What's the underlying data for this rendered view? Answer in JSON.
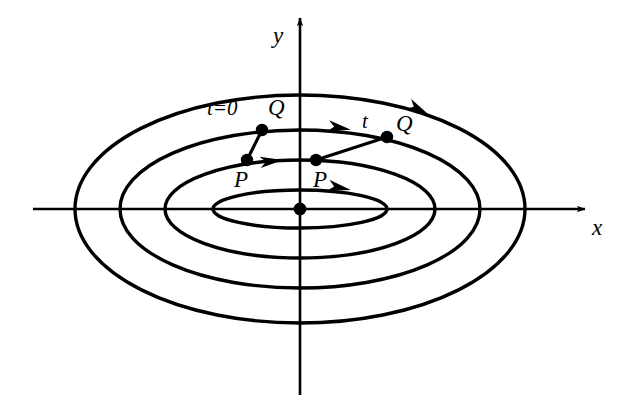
{
  "figure": {
    "background_color": "#ffffff",
    "stroke_color": "#000000",
    "width": 617,
    "height": 420
  },
  "axes": {
    "x_label": "x",
    "y_label": "y",
    "x_axis": {
      "x1": 33,
      "y1": 209,
      "x2": 585,
      "y2": 209
    },
    "y_axis": {
      "x1": 300,
      "y1": 395,
      "x2": 300,
      "y2": 18
    },
    "origin": {
      "x": 300,
      "y": 209
    },
    "x_label_pos": {
      "x": 592,
      "y": 216
    },
    "y_label_pos": {
      "x": 273,
      "y": 24
    }
  },
  "orbits": [
    {
      "name": "orbit-1-innermost",
      "cx": 300,
      "cy": 209,
      "rx": 87,
      "ry": 19
    },
    {
      "name": "orbit-2",
      "cx": 300,
      "cy": 209,
      "rx": 135,
      "ry": 49
    },
    {
      "name": "orbit-3",
      "cx": 300,
      "cy": 209,
      "rx": 180,
      "ry": 79
    },
    {
      "name": "orbit-4-outermost",
      "cx": 300,
      "cy": 209,
      "rx": 225,
      "ry": 114
    }
  ],
  "flow_arrows": [
    {
      "name": "flow-arrow-orbit-4",
      "x": 420,
      "y": 110,
      "angle": 28
    },
    {
      "name": "flow-arrow-orbit-3",
      "x": 341,
      "y": 128,
      "angle": 10
    },
    {
      "name": "flow-arrow-orbit-1",
      "x": 341,
      "y": 188,
      "angle": 12
    },
    {
      "name": "flow-arrow-orbit-2",
      "x": 273,
      "y": 161,
      "angle": -6
    }
  ],
  "points": [
    {
      "name": "point-P-initial",
      "label": "P",
      "x": 247,
      "y": 160,
      "label_x": 234,
      "label_y": 168
    },
    {
      "name": "point-Q-initial",
      "label": "Q",
      "x": 262,
      "y": 130,
      "label_x": 268,
      "label_y": 96
    },
    {
      "name": "point-P-time-t",
      "label": "P",
      "x": 316,
      "y": 160,
      "label_x": 313,
      "label_y": 168
    },
    {
      "name": "point-Q-time-t",
      "label": "Q",
      "x": 387,
      "y": 137,
      "label_x": 396,
      "label_y": 112
    }
  ],
  "connectors": [
    {
      "name": "connector-initial-PQ",
      "x1": 247,
      "y1": 160,
      "x2": 262,
      "y2": 130
    },
    {
      "name": "connector-time-t-PQ",
      "x1": 316,
      "y1": 160,
      "x2": 387,
      "y2": 137
    }
  ],
  "annotations": [
    {
      "name": "label-t-equals-0",
      "text": "t=0",
      "x": 207,
      "y": 98
    },
    {
      "name": "label-t",
      "text": "t",
      "x": 362,
      "y": 111
    }
  ]
}
